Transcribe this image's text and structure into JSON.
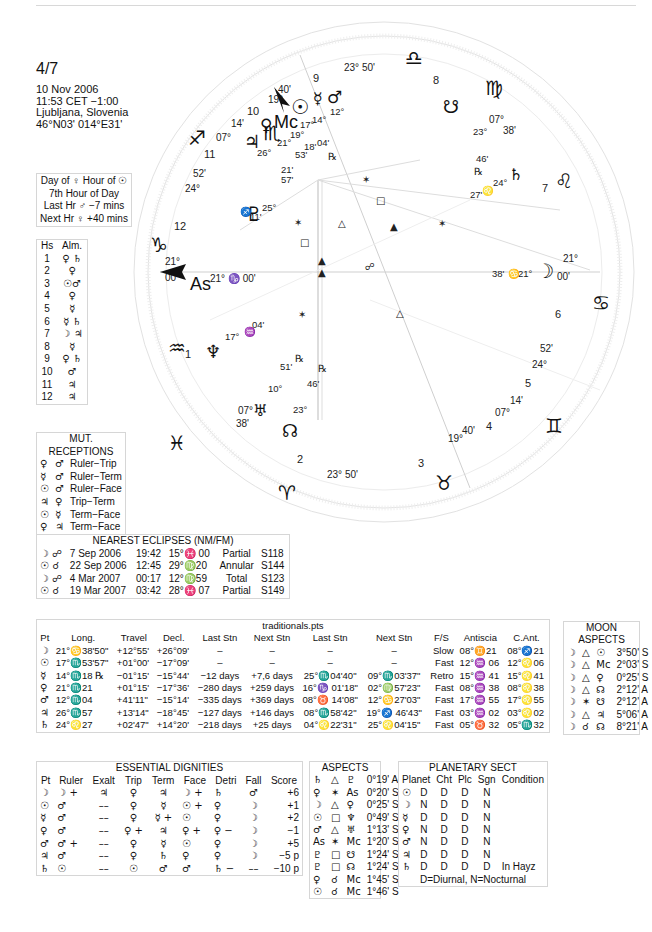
{
  "header": {
    "title": "4/7",
    "date": "10 Nov 2006",
    "time": "11:53  CET −1:00",
    "place": "Ljubljana, Slovenia",
    "coords": "46°N03' 014°E31'"
  },
  "day_hour": {
    "line1": "Day of ♀  Hour of ☉",
    "line2": "7th Hour of Day",
    "line3": "Last Hr ♂ −7 mins",
    "line4": "Next Hr ♀ +40 mins"
  },
  "almuten": {
    "headers": [
      "Hs",
      "Alm."
    ],
    "rows": [
      [
        "1",
        "♀ ♄"
      ],
      [
        "2",
        "♀"
      ],
      [
        "3",
        "☉♂"
      ],
      [
        "4",
        "♀"
      ],
      [
        "5",
        "☿"
      ],
      [
        "6",
        "☿ ♄"
      ],
      [
        "7",
        "☽ ♃"
      ],
      [
        "8",
        "☿"
      ],
      [
        "9",
        "♀ ♄"
      ],
      [
        "10",
        "♂"
      ],
      [
        "11",
        "♃"
      ],
      [
        "12",
        "♃"
      ]
    ]
  },
  "mutual_receptions": {
    "title": "MUT. RECEPTIONS",
    "rows": [
      [
        "♀",
        "♂",
        "Ruler−Trip"
      ],
      [
        "☿",
        "♂",
        "Ruler−Term"
      ],
      [
        "☉",
        "♂",
        "Ruler−Face"
      ],
      [
        "♃",
        "♀",
        "Trip−Term"
      ],
      [
        "☉",
        "☿",
        "Term−Face"
      ],
      [
        "♀",
        "♃",
        "Term−Face"
      ]
    ]
  },
  "eclipses": {
    "title": "NEAREST ECLIPSES (NM/FM)",
    "rows": [
      [
        "☽ ☍",
        "7 Sep 2006",
        "19:42",
        "15°♓ 00",
        "Partial",
        "S118"
      ],
      [
        "☉ ☌",
        "22 Sep 2006",
        "12:45",
        "29°♍20",
        "Annular",
        "S144"
      ],
      [
        "☽ ☍",
        "4 Mar 2007",
        "00:17",
        "12°♍59",
        "Total",
        "S123"
      ],
      [
        "☉ ☌",
        "19 Mar 2007",
        "03:42",
        "28°♓ 07",
        "Partial",
        "S149"
      ]
    ]
  },
  "traditionals": {
    "title": "traditionals.pts",
    "headers": [
      "Pt",
      "Long.",
      "Travel",
      "Decl.",
      "Last Stn",
      "Next Stn",
      "Last Stn",
      "Next Stn",
      "F/S",
      "Antiscia",
      "C.Ant."
    ],
    "rows": [
      [
        "☽",
        "21°♋38'50\"",
        "+12°55'",
        "+26°09'",
        "–",
        "–",
        "–",
        "–",
        "Slow",
        "08°♊21",
        "08°♐21"
      ],
      [
        "☉",
        "17°♏53'57\"",
        "+01°00'",
        "−17°09'",
        "–",
        "–",
        "–",
        "–",
        "Fast",
        "12°♒ 06",
        "12°♌06"
      ],
      [
        "☿",
        "14°♏18 ℞",
        "−01°15'",
        "−15°44'",
        "−12 days",
        "+7,6 days",
        "25°♏04'40\"",
        "09°♏03'37\"",
        "Retro",
        "15°♒ 41",
        "15°♌41"
      ],
      [
        "♀",
        "21°♏21",
        "+01°15'",
        "−17°36'",
        "−280 days",
        "+259 days",
        "16°♑ 01'18\"",
        "02°♍57'23\"",
        "Fast",
        "08°♒ 38",
        "08°♌38"
      ],
      [
        "♂",
        "12°♏04",
        "+41'11\"",
        "−15°14'",
        "−335 days",
        "+369 days",
        "08°♉ 14'08\"",
        "12°♋27'03\"",
        "Fast",
        "17°♒ 55",
        "17°♌55"
      ],
      [
        "♃",
        "26°♏57",
        "+13'14\"",
        "−18°45'",
        "−127 days",
        "+146 days",
        "08°♏58'42\"",
        "19°♐ 46'43\"",
        "Fast",
        "03°♒ 02",
        "03°♌02"
      ],
      [
        "♄",
        "24°♌27",
        "+02'47\"",
        "+14°20'",
        "−218 days",
        "+25 days",
        "04°♌22'31\"",
        "25°♌04'15\"",
        "Fast",
        "05°♉ 32",
        "05°♏32"
      ]
    ]
  },
  "moon_aspects": {
    "title": "MOON ASPECTS",
    "rows": [
      [
        "☽",
        "△",
        "☉",
        "3°50' S"
      ],
      [
        "☽",
        "△",
        "Mc",
        "2°03' S"
      ],
      [
        "☽",
        "△",
        "♀",
        "0°25' S"
      ],
      [
        "☽",
        "△",
        "☊",
        "2°12' A"
      ],
      [
        "☽",
        "✶",
        "☋",
        "2°12' A"
      ],
      [
        "☽",
        "△",
        "♃",
        "5°06' A"
      ],
      [
        "☽",
        "☌",
        "☊",
        "8°21' A"
      ]
    ]
  },
  "dignities": {
    "title": "ESSENTIAL DIGNITIES",
    "headers": [
      "Pt",
      "Ruler",
      "Exalt",
      "Trip",
      "Term",
      "Face",
      "Detri",
      "Fall",
      "Score"
    ],
    "rows": [
      [
        "☽",
        "☽ +",
        "♃",
        "♀",
        "♃",
        "☽ +",
        "♄",
        "♂",
        "+6"
      ],
      [
        "☉",
        "♂",
        "––",
        "♀",
        "☿",
        "☉ +",
        "♀",
        "☽",
        "+1"
      ],
      [
        "☿",
        "♂",
        "––",
        "♀",
        "☿ +",
        "☉",
        "♀",
        "☽",
        "+2"
      ],
      [
        "♀",
        "♂",
        "––",
        "♀ +",
        "♃",
        "♀ +",
        "♀ −",
        "☽",
        "−1"
      ],
      [
        "♂",
        "♂ +",
        "––",
        "♀",
        "☿",
        "☉",
        "♀",
        "☽",
        "+5"
      ],
      [
        "♃",
        "♂",
        "––",
        "♀",
        "♄",
        "♀",
        "♀",
        "☽",
        "−5 p"
      ],
      [
        "♄",
        "☉",
        "––",
        "☉",
        "♂",
        "♂",
        "♄ −",
        "––",
        "−10 p"
      ]
    ]
  },
  "aspects": {
    "title": "ASPECTS",
    "rows": [
      [
        "♄",
        "△",
        "♇",
        "0°19' A"
      ],
      [
        "♀",
        "✶",
        "As",
        "0°20' S"
      ],
      [
        "☽",
        "△",
        "♀",
        "0°25' S"
      ],
      [
        "☉",
        "□",
        "♆",
        "0°49' S"
      ],
      [
        "♂",
        "△",
        "♅",
        "1°13' S"
      ],
      [
        "As",
        "✶",
        "Mc",
        "1°20' S"
      ],
      [
        "♇",
        "□",
        "☋",
        "1°24' S"
      ],
      [
        "♇",
        "□",
        "☊",
        "1°24' S"
      ],
      [
        "♀",
        "☌",
        "Mc",
        "1°45' S"
      ],
      [
        "☉",
        "☌",
        "Mc",
        "1°46' S"
      ]
    ]
  },
  "sect": {
    "title": "PLANETARY SECT",
    "headers": [
      "Planet",
      "Cht",
      "Plc",
      "Sgn",
      "Condition"
    ],
    "rows": [
      [
        "☉",
        "D",
        "D",
        "D",
        "N",
        ""
      ],
      [
        "☽",
        "N",
        "D",
        "D",
        "N",
        ""
      ],
      [
        "☿",
        "D",
        "D",
        "D",
        "N",
        ""
      ],
      [
        "♀",
        "N",
        "D",
        "D",
        "N",
        ""
      ],
      [
        "♂",
        "N",
        "D",
        "D",
        "N",
        ""
      ],
      [
        "♃",
        "D",
        "D",
        "D",
        "N",
        ""
      ],
      [
        "♄",
        "D",
        "D",
        "D",
        "D",
        "In Hayz"
      ]
    ],
    "footer": "D=Diurnal, N=Nocturnal"
  },
  "wheel": {
    "asc": "21° ♑ 00'",
    "asc_label": "As",
    "mc_label": "Mc",
    "cusp_labels": {
      "c1": "21°",
      "c1m": "00'",
      "c2_3": "23° 50'",
      "c4a": "19°",
      "c4b": "40'",
      "c5a": "07°",
      "c5b": "14'",
      "c6a": "24°",
      "c6b": "52'",
      "c7a": "21°",
      "c7b": "00'",
      "c8a": "07°",
      "c8b": "38'",
      "c9": "23° 50'",
      "c10a": "19°",
      "c10b": "40'",
      "c11a": "07°",
      "c11b": "14'",
      "c12a": "24°",
      "c12b": "52'",
      "c2a": "07°",
      "c2b": "38'"
    },
    "house_numbers": [
      "1",
      "2",
      "3",
      "4",
      "5",
      "6",
      "7",
      "8",
      "9",
      "10",
      "11",
      "12"
    ],
    "planets": {
      "moon": {
        "deg": "21°",
        "sign": "♋",
        "min": "38'"
      },
      "sun": {
        "deg": "17°",
        "min": "53'"
      },
      "mercury": {
        "deg": "14°",
        "min": "18'",
        "retro": "℞"
      },
      "mars": {
        "deg": "12°",
        "min": "04'"
      },
      "venus": {
        "deg": "21°",
        "min": "21'"
      },
      "jupiter": {
        "deg": "26°",
        "min": "57'"
      },
      "mc_pos": {
        "deg": "19°",
        "min": "40'"
      },
      "saturn": {
        "deg": "24°",
        "sign": "♌",
        "min": "27'"
      },
      "pluto": {
        "deg": "25°",
        "sign": "♐",
        "min": "11'"
      },
      "neptune": {
        "deg": "17°",
        "sign": "♒",
        "min": "04'"
      },
      "uranus": {
        "deg": "10°",
        "sign": "♓",
        "min": "51'",
        "retro": "℞"
      },
      "node": {
        "deg": "23°",
        "sign": "♓",
        "min": "46'",
        "retro": "℞"
      },
      "snode": {
        "deg": "23°",
        "sign": "♍",
        "min": "46'",
        "retro": "℞"
      }
    }
  }
}
